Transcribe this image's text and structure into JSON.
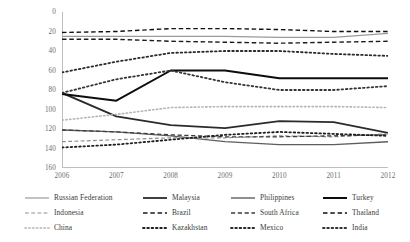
{
  "chart_data": {
    "type": "line",
    "title": "",
    "xlabel": "",
    "ylabel": "",
    "x": [
      2006,
      2007,
      2008,
      2009,
      2010,
      2011,
      2012
    ],
    "xticklabels": [
      "2006",
      "2007",
      "2008",
      "2009",
      "2010",
      "2011",
      "2012"
    ],
    "xlim": [
      2006,
      2012
    ],
    "ylim": [
      0,
      160
    ],
    "y_inverted": true,
    "yticks": [
      0,
      20,
      40,
      60,
      80,
      100,
      120,
      140,
      160
    ],
    "yticklabels": [
      "0",
      "20",
      "40",
      "60",
      "80",
      "100",
      "120",
      "140",
      "160"
    ],
    "grid": false,
    "legend_position": "bottom",
    "series": [
      {
        "name": "Russian Federation",
        "style": "solid",
        "color": "#9a9a9a",
        "width": 1.2,
        "values": [
          25,
          25,
          25,
          25,
          26,
          26,
          22
        ]
      },
      {
        "name": "Malaysia",
        "style": "solid",
        "color": "#2b2b2b",
        "width": 1.8,
        "values": [
          83,
          107,
          116,
          119,
          112,
          113,
          124
        ]
      },
      {
        "name": "Philippines",
        "style": "solid",
        "color": "#5d5d5d",
        "width": 1.4,
        "values": [
          121,
          123,
          127,
          133,
          136,
          136,
          133
        ]
      },
      {
        "name": "Turkey",
        "style": "solid",
        "color": "#0d0d0d",
        "width": 2.0,
        "values": [
          84,
          91,
          60,
          60,
          68,
          68,
          68
        ]
      },
      {
        "name": "Indonesia",
        "style": "dashed",
        "color": "#8f8f8f",
        "width": 1.2,
        "values": [
          133,
          131,
          129,
          129,
          127,
          128,
          125
        ]
      },
      {
        "name": "Brazil",
        "style": "dashed",
        "color": "#1a1a1a",
        "width": 1.4,
        "values": [
          28,
          28,
          30,
          31,
          32,
          31,
          30
        ]
      },
      {
        "name": "South Africa",
        "style": "dashed",
        "color": "#3d3d3d",
        "width": 1.3,
        "values": [
          121,
          123,
          126,
          128,
          128,
          127,
          126
        ]
      },
      {
        "name": "Thailand",
        "style": "dashed",
        "color": "#111111",
        "width": 1.4,
        "values": [
          21,
          20,
          17,
          17,
          18,
          20,
          20
        ]
      },
      {
        "name": "China",
        "style": "dotted",
        "color": "#b5b5b5",
        "width": 1.6,
        "values": [
          111,
          105,
          98,
          97,
          97,
          97,
          98
        ]
      },
      {
        "name": "Kazakhstan",
        "style": "dotted",
        "color": "#202020",
        "width": 1.8,
        "values": [
          139,
          136,
          131,
          126,
          123,
          125,
          127
        ]
      },
      {
        "name": "Mexico",
        "style": "dotted",
        "color": "#2a2a2a",
        "width": 1.8,
        "values": [
          62,
          51,
          42,
          40,
          40,
          43,
          45
        ]
      },
      {
        "name": "India",
        "style": "dotted",
        "color": "#343434",
        "width": 1.8,
        "values": [
          83,
          69,
          60,
          72,
          80,
          80,
          76
        ]
      }
    ]
  },
  "axes": {
    "y_title": "",
    "x_title": ""
  },
  "legend": {
    "rows": [
      [
        {
          "label": "Russian Federation",
          "series": 0
        },
        {
          "label": "Malaysia",
          "series": 1
        },
        {
          "label": "Philippines",
          "series": 2
        },
        {
          "label": "Turkey",
          "series": 3
        }
      ],
      [
        {
          "label": "Indonesia",
          "series": 4
        },
        {
          "label": "Brazil",
          "series": 5
        },
        {
          "label": "South Africa",
          "series": 6
        },
        {
          "label": "Thailand",
          "series": 7
        }
      ],
      [
        {
          "label": "China",
          "series": 8
        },
        {
          "label": "Kazakhstan",
          "series": 9
        },
        {
          "label": "Mexico",
          "series": 10
        },
        {
          "label": "India",
          "series": 11
        }
      ]
    ]
  }
}
